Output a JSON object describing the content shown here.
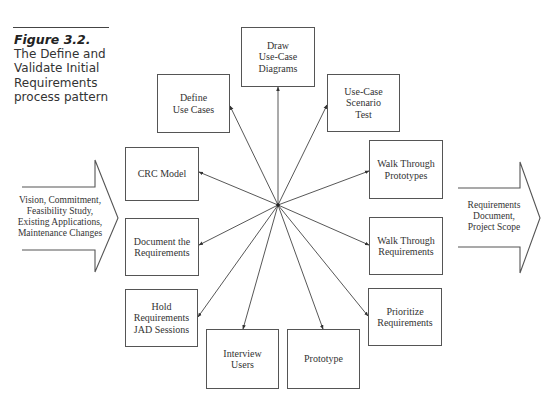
{
  "figure": {
    "label": "Figure 3.2.",
    "title": "The Define and\nValidate Initial\nRequirements\nprocess pattern"
  },
  "inputs": {
    "text": "Vision, Commitment,\nFeasibility Study,\nExisting Applications,\nMaintenance Changes"
  },
  "outputs": {
    "text": "Requirements\nDocument,\nProject Scope"
  },
  "hub": {
    "x": 278,
    "y": 205
  },
  "activities": [
    {
      "id": "draw-use-case-diagrams",
      "label": "Draw\nUse-Case\nDiagrams",
      "x": 241,
      "y": 27,
      "w": 74,
      "h": 60,
      "tip": [
        278,
        87
      ]
    },
    {
      "id": "define-use-cases",
      "label": "Define\nUse Cases",
      "x": 157,
      "y": 74,
      "w": 73,
      "h": 59,
      "tip": [
        230,
        106
      ]
    },
    {
      "id": "use-case-scenario-test",
      "label": "Use-Case\nScenario\nTest",
      "x": 327,
      "y": 74,
      "w": 73,
      "h": 58,
      "tip": [
        327,
        105
      ]
    },
    {
      "id": "crc-model",
      "label": "CRC Model",
      "x": 125,
      "y": 147,
      "w": 74,
      "h": 54,
      "tip": [
        199,
        172
      ]
    },
    {
      "id": "walk-through-prototypes",
      "label": "Walk Through\nPrototypes",
      "x": 369,
      "y": 140,
      "w": 74,
      "h": 59,
      "tip": [
        369,
        171
      ]
    },
    {
      "id": "document-the-requirements",
      "label": "Document the\nRequirements",
      "x": 125,
      "y": 218,
      "w": 74,
      "h": 58,
      "tip": [
        199,
        245
      ]
    },
    {
      "id": "walk-through-requirements",
      "label": "Walk Through\nRequirements",
      "x": 369,
      "y": 217,
      "w": 74,
      "h": 58,
      "tip": [
        369,
        245
      ]
    },
    {
      "id": "hold-requirements-jad-sessions",
      "label": "Hold\nRequirements\nJAD Sessions",
      "x": 125,
      "y": 289,
      "w": 73,
      "h": 58,
      "tip": [
        198,
        317
      ]
    },
    {
      "id": "prioritize-requirements",
      "label": "Prioritize\nRequirements",
      "x": 368,
      "y": 288,
      "w": 74,
      "h": 58,
      "tip": [
        368,
        316
      ]
    },
    {
      "id": "interview-users",
      "label": "Interview\nUsers",
      "x": 206,
      "y": 329,
      "w": 73,
      "h": 60,
      "tip": [
        243,
        329
      ]
    },
    {
      "id": "prototype",
      "label": "Prototype",
      "x": 287,
      "y": 329,
      "w": 73,
      "h": 60,
      "tip": [
        323,
        329
      ]
    }
  ],
  "colors": {
    "stroke": "#555555",
    "text": "#333333",
    "background": "#ffffff"
  }
}
